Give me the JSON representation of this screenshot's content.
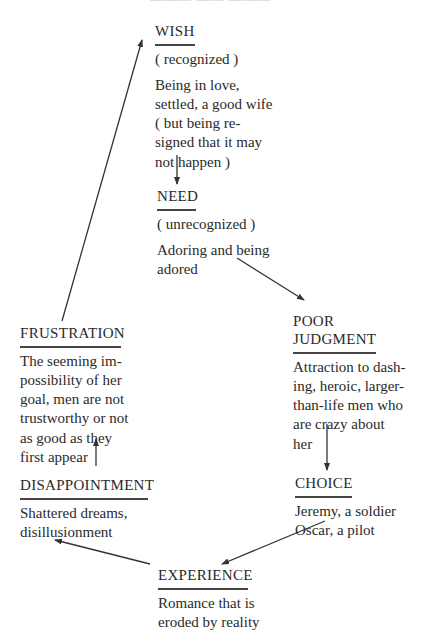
{
  "header_cut_text": "———  ——  ———",
  "diagram": {
    "nodes": {
      "wish": {
        "title": "WISH",
        "subtitle": "( recognized )",
        "body": "Being in love,\nsettled, a good wife\n( but being re-\nsigned that it may\nnot happen )"
      },
      "need": {
        "title": "NEED",
        "subtitle": "( unrecognized )",
        "body": "Adoring and being\nadored"
      },
      "poor_judgment": {
        "title": "POOR\nJUDGMENT",
        "body": "Attraction to dash-\ning, heroic, larger-\nthan-life men who\nare crazy about\nher"
      },
      "choice": {
        "title": "CHOICE",
        "body": "Jeremy, a soldier\nOscar, a pilot"
      },
      "experience": {
        "title": "EXPERIENCE",
        "body": "Romance that is\neroded by reality"
      },
      "disappointment": {
        "title": "DISAPPOINTMENT",
        "body": "Shattered dreams,\ndisillusionment"
      },
      "frustration": {
        "title": "FRUSTRATION",
        "body": "The seeming im-\npossibility of her\ngoal, men are not\ntrustworthy or not\nas good as they\nfirst appear"
      }
    },
    "edges": [
      {
        "from": "wish",
        "to": "need"
      },
      {
        "from": "need",
        "to": "poor_judgment"
      },
      {
        "from": "poor_judgment",
        "to": "choice"
      },
      {
        "from": "choice",
        "to": "experience"
      },
      {
        "from": "experience",
        "to": "disappointment"
      },
      {
        "from": "disappointment",
        "to": "frustration"
      },
      {
        "from": "frustration",
        "to": "wish"
      }
    ],
    "colors": {
      "text": "#2a2a2a",
      "line": "#444444",
      "background": "#ffffff"
    }
  }
}
